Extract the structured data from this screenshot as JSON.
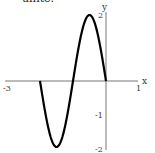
{
  "header": {
    "partial_text": "unite."
  },
  "chart_data": {
    "type": "line",
    "title": "",
    "xlabel": "x",
    "ylabel": "y",
    "xlim": [
      -3,
      1
    ],
    "ylim": [
      -2,
      2
    ],
    "x_ticks": [
      "-3",
      "1"
    ],
    "y_ticks": [
      "2",
      "-1",
      "-2"
    ],
    "grid": false,
    "series": [
      {
        "name": "y = -2 sin(πx)",
        "x": [
          -2,
          -1.75,
          -1.5,
          -1.25,
          -1,
          -0.75,
          -0.5,
          -0.25,
          0
        ],
        "values": [
          0,
          -1.41,
          -2,
          -1.41,
          0,
          1.41,
          2,
          1.41,
          0
        ]
      }
    ]
  }
}
